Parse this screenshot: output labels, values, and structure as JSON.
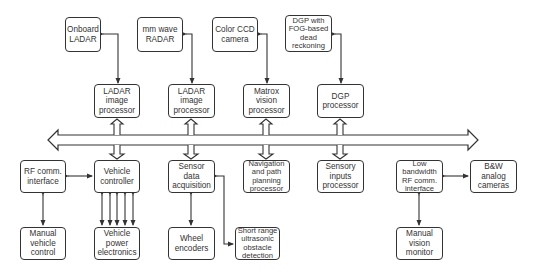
{
  "diagram": {
    "type": "block-diagram",
    "bus": {
      "label": ""
    },
    "top_sensors": [
      {
        "id": "onboard-ladar",
        "label": "Onboard\nLADAR",
        "x": 65,
        "y": 17,
        "w": 36,
        "h": 35
      },
      {
        "id": "mm-wave-radar",
        "label": "mm wave\nRADAR",
        "x": 137,
        "y": 17,
        "w": 46,
        "h": 35
      },
      {
        "id": "color-ccd-camera",
        "label": "Color CCD\ncamera",
        "x": 212,
        "y": 17,
        "w": 46,
        "h": 35
      },
      {
        "id": "dgp-fog",
        "label": "DGP with\nFOG-based\ndead\nreckoning",
        "x": 285,
        "y": 15,
        "w": 47,
        "h": 37
      }
    ],
    "processors": [
      {
        "id": "ladar-image-processor-1",
        "label": "LADAR\nimage\nprocessor",
        "x": 94,
        "y": 84,
        "w": 46,
        "h": 34
      },
      {
        "id": "ladar-image-processor-2",
        "label": "LADAR\nimage\nprocessor",
        "x": 168,
        "y": 84,
        "w": 47,
        "h": 34
      },
      {
        "id": "matrox-vision-processor",
        "label": "Matrox\nvision\nprocessor",
        "x": 243,
        "y": 84,
        "w": 47,
        "h": 34
      },
      {
        "id": "dgp-processor",
        "label": "DGP\nprocessor",
        "x": 317,
        "y": 84,
        "w": 47,
        "h": 34
      }
    ],
    "bottom_modules": [
      {
        "id": "rf-comm-interface",
        "label": "RF comm.\ninterface",
        "x": 20,
        "y": 160,
        "w": 46,
        "h": 33
      },
      {
        "id": "vehicle-controller",
        "label": "Vehicle\ncontroller",
        "x": 94,
        "y": 160,
        "w": 46,
        "h": 33
      },
      {
        "id": "sensor-data-acquisition",
        "label": "Sensor\ndata\nacquisition",
        "x": 168,
        "y": 160,
        "w": 47,
        "h": 33
      },
      {
        "id": "navigation-path-planning",
        "label": "Navigation\nand path\nplanning\nprocessor",
        "x": 243,
        "y": 160,
        "w": 47,
        "h": 33
      },
      {
        "id": "sensory-inputs-processor",
        "label": "Sensory\ninputs\nprocessor",
        "x": 317,
        "y": 160,
        "w": 47,
        "h": 33
      },
      {
        "id": "low-bandwidth-rf",
        "label": "Low\nbandwidth\nRF comm.\ninterface",
        "x": 396,
        "y": 160,
        "w": 47,
        "h": 33
      },
      {
        "id": "bw-analog-cameras",
        "label": "B&W\nanalog\ncameras",
        "x": 470,
        "y": 160,
        "w": 47,
        "h": 33
      }
    ],
    "lower_tier": [
      {
        "id": "manual-vehicle-control",
        "label": "Manual\nvehicle\ncontrol",
        "x": 20,
        "y": 227,
        "w": 46,
        "h": 33
      },
      {
        "id": "vehicle-power-electronics",
        "label": "Vehicle\npower\nelectronics",
        "x": 94,
        "y": 227,
        "w": 46,
        "h": 33
      },
      {
        "id": "wheel-encoders",
        "label": "Wheel\nencoders",
        "x": 168,
        "y": 227,
        "w": 47,
        "h": 33
      },
      {
        "id": "short-range-ultrasonic",
        "label": "Short range\nultrasonic\nobstacle\ndetection",
        "x": 235,
        "y": 227,
        "w": 45,
        "h": 33
      },
      {
        "id": "manual-vision-monitor",
        "label": "Manual\nvision\nmonitor",
        "x": 396,
        "y": 227,
        "w": 47,
        "h": 33
      }
    ],
    "connections": [
      "Onboard LADAR <-> LADAR image processor",
      "mm wave RADAR <-> LADAR image processor",
      "Color CCD camera <-> Matrox vision processor",
      "DGP with FOG-based dead reckoning <-> DGP processor",
      "Processors => bus (hollow double arrows)",
      "Bus => Vehicle controller, Sensor data acquisition, Navigation and path planning processor, Sensory inputs processor",
      "RF comm. interface <-> Vehicle controller",
      "RF comm. interface <-> Manual vehicle control",
      "Vehicle controller <-> Vehicle power electronics (x5)",
      "Sensor data acquisition <-> Wheel encoders",
      "Sensor data acquisition <-> Short range ultrasonic obstacle detection",
      "Low bandwidth RF comm. interface <-> B&W analog cameras",
      "Low bandwidth RF comm. interface <-> Manual vision monitor"
    ],
    "colors": {
      "stroke": "#333333",
      "background": "#ffffff",
      "text": "#333333"
    }
  }
}
